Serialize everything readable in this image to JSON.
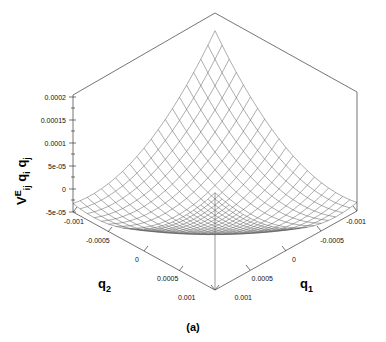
{
  "figure": {
    "caption": "(a)",
    "type": "3d-wireframe-surface"
  },
  "chart_data": {
    "type": "surface",
    "title": "",
    "zlabel": "V",
    "zlabel_sup": "E",
    "zlabel_sub": "ij",
    "zlabel_rest": "q",
    "zlabel_rest_sub1": "i",
    "zlabel_rest2": "q",
    "zlabel_rest_sub2": "j",
    "zlabel_full": "V^E_ij q_i q_j",
    "xlabel": "q",
    "xlabel_sub": "1",
    "ylabel": "q",
    "ylabel_sub": "2",
    "x_ticks": [
      "-0.001",
      "-0.0005",
      "0",
      "0.0005",
      "0.001"
    ],
    "x_values": [
      -0.001,
      -0.0005,
      0,
      0.0005,
      0.001
    ],
    "y_ticks": [
      "-0.001",
      "-0.0005",
      "0",
      "0.0005",
      "0.001"
    ],
    "y_values": [
      -0.001,
      -0.0005,
      0,
      0.0005,
      0.001
    ],
    "z_ticks": [
      "0.0002",
      "0.00015",
      "0.0001",
      "5e-05",
      "0",
      "-5e-05"
    ],
    "z_values": [
      0.0002,
      0.00015,
      0.0001,
      5e-05,
      0,
      -5e-05
    ],
    "xlim": [
      -0.001,
      0.001
    ],
    "ylim": [
      -0.001,
      0.001
    ],
    "zlim": [
      -5e-05,
      0.0002
    ],
    "grid": false,
    "legend": "none",
    "mesh_divisions": 20,
    "surface_description": "Saddle-shaped quadratic form rising to a peak at the far corner (q1=-0.001, q2=-0.001) and falling at the left and right corners",
    "corner_values": {
      "back_peak": 0.0002,
      "left": -7e-05,
      "right": -7e-05,
      "front": -2e-05
    },
    "colors": {
      "mesh": "#4a4a4a",
      "box": "#3a3a3a",
      "text": "#000000",
      "background": "#ffffff"
    }
  }
}
